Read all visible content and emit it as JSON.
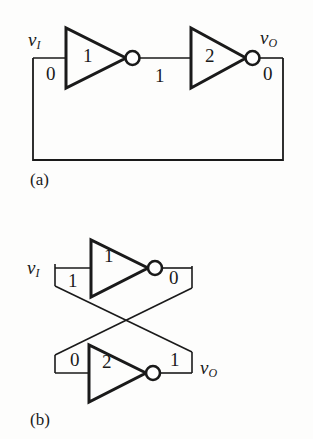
{
  "figure": {
    "background_color": "#fdfdfc",
    "line_color": "#1a1a1a",
    "panels": [
      {
        "id": "a",
        "caption": "(a)",
        "description": "Two cascaded inverters in a feedback loop (bistable latch shown unrolled)",
        "input_label": "v",
        "input_subscript": "I",
        "output_label": "v",
        "output_subscript": "O",
        "input_value": "0",
        "mid_value": "1",
        "output_value": "0",
        "inverters": [
          {
            "name": "1"
          },
          {
            "name": "2"
          }
        ]
      },
      {
        "id": "b",
        "caption": "(b)",
        "description": "Cross-coupled inverter pair (bistable latch) with crossing feedback lines",
        "input_label": "v",
        "input_subscript": "I",
        "output_label": "v",
        "output_subscript": "O",
        "top_input_value": "1",
        "top_output_value": "0",
        "bottom_input_value": "0",
        "bottom_output_value": "1",
        "inverters": [
          {
            "name": "1"
          },
          {
            "name": "2"
          }
        ]
      }
    ]
  }
}
